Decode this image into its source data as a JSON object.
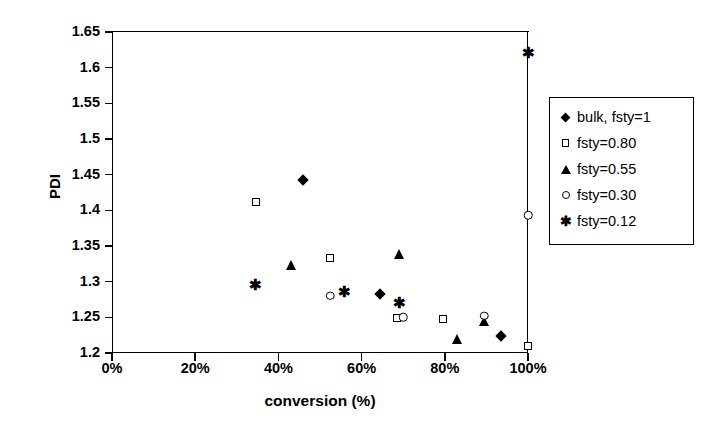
{
  "chart_data": {
    "type": "scatter",
    "title": "",
    "xlabel": "conversion (%)",
    "ylabel": "PDI",
    "xlim": [
      0,
      100
    ],
    "ylim": [
      1.2,
      1.65
    ],
    "grid": false,
    "legend_position": "right",
    "x_ticks": [
      "0%",
      "20%",
      "40%",
      "60%",
      "80%",
      "100%"
    ],
    "x_tick_values": [
      0,
      20,
      40,
      60,
      80,
      100
    ],
    "y_ticks": [
      "1.2",
      "1.25",
      "1.3",
      "1.35",
      "1.4",
      "1.45",
      "1.5",
      "1.55",
      "1.6",
      "1.65"
    ],
    "y_tick_values": [
      1.2,
      1.25,
      1.3,
      1.35,
      1.4,
      1.45,
      1.5,
      1.55,
      1.6,
      1.65
    ],
    "series": [
      {
        "name": "bulk, fsty=1",
        "marker": "filled-diamond",
        "points": [
          {
            "x": 46,
            "y": 1.443
          },
          {
            "x": 64.5,
            "y": 1.283
          },
          {
            "x": 93.5,
            "y": 1.224
          }
        ]
      },
      {
        "name": "fsty=0.80",
        "marker": "open-square",
        "points": [
          {
            "x": 34.7,
            "y": 1.412
          },
          {
            "x": 52.5,
            "y": 1.333
          },
          {
            "x": 68.5,
            "y": 1.249
          },
          {
            "x": 79.5,
            "y": 1.247
          },
          {
            "x": 100,
            "y": 1.21
          }
        ]
      },
      {
        "name": "fsty=0.55",
        "marker": "filled-triangle",
        "points": [
          {
            "x": 43,
            "y": 1.324
          },
          {
            "x": 69,
            "y": 1.339
          },
          {
            "x": 83,
            "y": 1.22
          },
          {
            "x": 89.5,
            "y": 1.245
          }
        ]
      },
      {
        "name": "fsty=0.30",
        "marker": "open-circle",
        "points": [
          {
            "x": 52.5,
            "y": 1.28
          },
          {
            "x": 70,
            "y": 1.25
          },
          {
            "x": 89.5,
            "y": 1.252
          },
          {
            "x": 100,
            "y": 1.393
          }
        ]
      },
      {
        "name": "fsty=0.12",
        "marker": "asterisk",
        "points": [
          {
            "x": 34.5,
            "y": 1.297
          },
          {
            "x": 56,
            "y": 1.287
          },
          {
            "x": 69,
            "y": 1.272
          },
          {
            "x": 100,
            "y": 1.622
          }
        ]
      }
    ]
  },
  "axes": {
    "y_title": "PDI",
    "x_title": "conversion (%)"
  },
  "legend": {
    "entries": [
      {
        "label": "bulk, fsty=1",
        "marker": "filled-diamond"
      },
      {
        "label": "fsty=0.80",
        "marker": "open-square"
      },
      {
        "label": "fsty=0.55",
        "marker": "filled-triangle"
      },
      {
        "label": "fsty=0.30",
        "marker": "open-circle"
      },
      {
        "label": "fsty=0.12",
        "marker": "asterisk"
      }
    ]
  },
  "style": {
    "marker_color": "#000000",
    "axis_color": "#000000",
    "background": "#ffffff",
    "asterisk_glyph": "✱"
  }
}
